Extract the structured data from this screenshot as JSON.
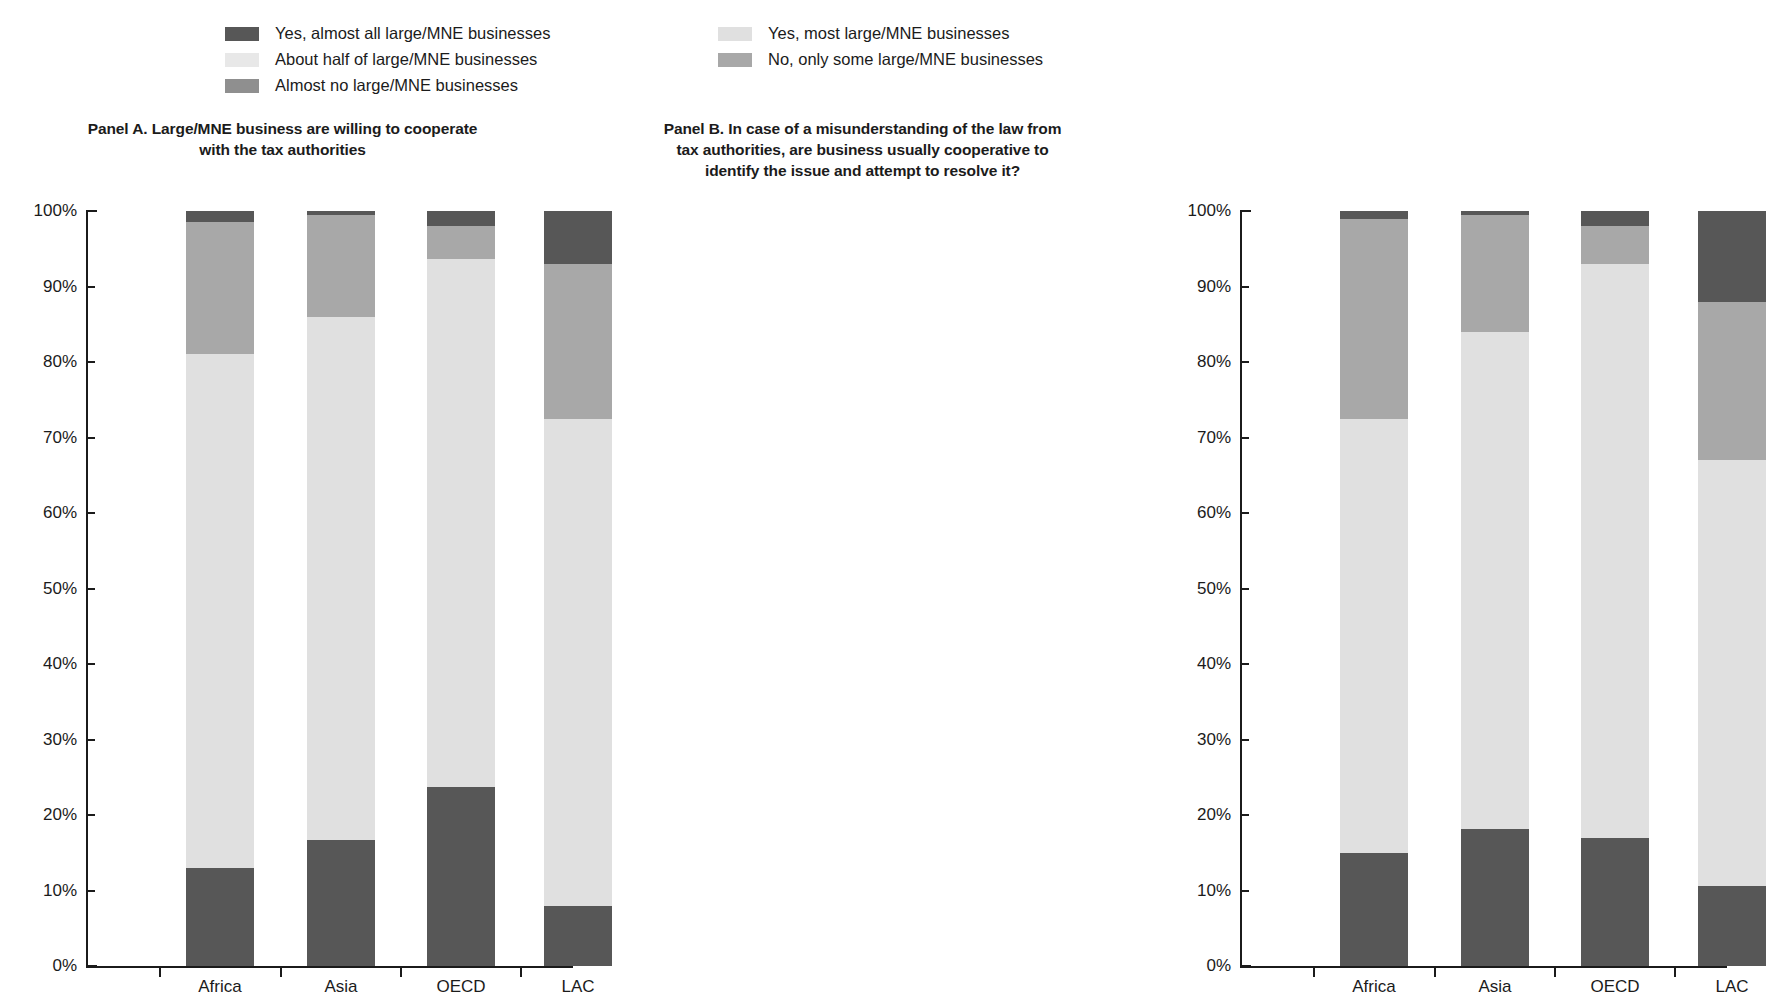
{
  "legend": {
    "left_column": [
      {
        "label": "Yes, almost all large/MNE businesses",
        "color": "#575757",
        "key": "yes_almost_all"
      },
      {
        "label": "About half of large/MNE businesses",
        "color": "#e8e8e8",
        "key": "about_half"
      },
      {
        "label": "Almost no large/MNE businesses",
        "color": "#8f8f8f",
        "key": "almost_no"
      }
    ],
    "right_column": [
      {
        "label": "Yes, most large/MNE businesses",
        "color": "#e0e0e0",
        "key": "yes_most"
      },
      {
        "label": "No, only some large/MNE businesses",
        "color": "#a8a8a8",
        "key": "no_only_some"
      }
    ]
  },
  "axis": {
    "y_ticks": [
      "100%",
      "90%",
      "80%",
      "70%",
      "60%",
      "50%",
      "40%",
      "30%",
      "20%",
      "10%",
      "0%"
    ],
    "y_min": 0,
    "y_max": 100,
    "categories": [
      "Africa",
      "Asia",
      "OECD",
      "LAC"
    ]
  },
  "panels": [
    {
      "id": "panel-a",
      "title_line1": "Panel A. Large/MNE business are willing to cooperate",
      "title_line2": "with the tax authorities"
    },
    {
      "id": "panel-b",
      "title_line1": "Panel B.  In case of a misunderstanding of the law from",
      "title_line2": "tax authorities, are business usually cooperative to",
      "title_line3": "identify the issue and attempt to resolve it?"
    }
  ],
  "chart_data": [
    {
      "type": "bar",
      "stacked": true,
      "percent": true,
      "title": "Panel A. Large/MNE business are willing to cooperate with the tax authorities",
      "xlabel": "",
      "ylabel": "",
      "ylim": [
        0,
        100
      ],
      "grid": false,
      "legend_position": "top",
      "categories": [
        "Africa",
        "Asia",
        "OECD",
        "LAC"
      ],
      "series": [
        {
          "name": "Yes, almost all large/MNE businesses",
          "color": "#575757",
          "values": [
            13.0,
            16.7,
            23.7,
            8.0
          ]
        },
        {
          "name": "Yes, most large/MNE businesses",
          "color": "#e0e0e0",
          "values": [
            68.0,
            69.3,
            70.0,
            64.5
          ]
        },
        {
          "name": "No, only some large/MNE businesses",
          "color": "#a8a8a8",
          "values": [
            17.5,
            13.5,
            4.3,
            20.5
          ]
        },
        {
          "name": "Almost no large/MNE businesses",
          "color": "#575757",
          "values": [
            1.5,
            0.5,
            2.0,
            7.0
          ]
        }
      ]
    },
    {
      "type": "bar",
      "stacked": true,
      "percent": true,
      "title": "Panel B.  In case of a misunderstanding of the law from tax authorities, are business usually cooperative to identify the issue and attempt to resolve it?",
      "xlabel": "",
      "ylabel": "",
      "ylim": [
        0,
        100
      ],
      "grid": false,
      "legend_position": "top",
      "categories": [
        "Africa",
        "Asia",
        "OECD",
        "LAC"
      ],
      "series": [
        {
          "name": "Yes, almost all large/MNE businesses",
          "color": "#575757",
          "values": [
            15.0,
            18.2,
            17.0,
            10.6
          ]
        },
        {
          "name": "Yes, most large/MNE businesses",
          "color": "#e0e0e0",
          "values": [
            57.5,
            65.8,
            76.0,
            56.4
          ]
        },
        {
          "name": "No, only some large/MNE businesses",
          "color": "#a8a8a8",
          "values": [
            26.5,
            15.5,
            5.0,
            21.0
          ]
        },
        {
          "name": "Almost no large/MNE businesses",
          "color": "#575757",
          "values": [
            1.0,
            0.5,
            2.0,
            12.0
          ]
        }
      ]
    }
  ]
}
